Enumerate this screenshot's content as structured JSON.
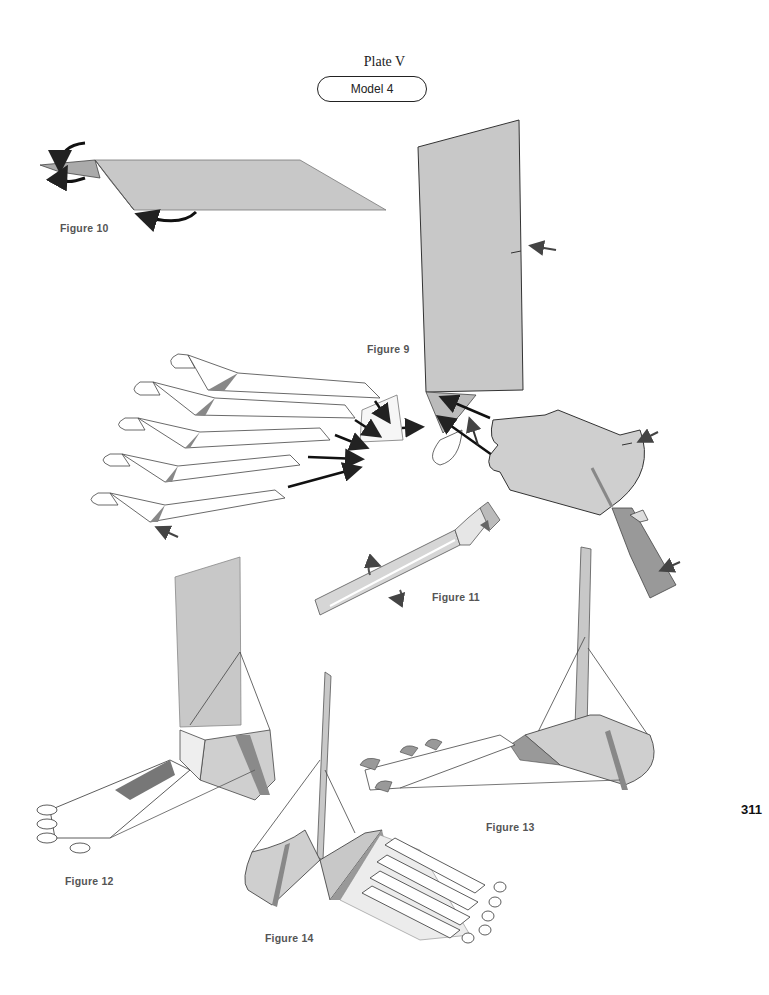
{
  "header": {
    "plate_title": "Plate V",
    "model_label": "Model 4"
  },
  "figures": [
    {
      "id": "figure-9",
      "label": "Figure 9",
      "description": "Leg panel with toe strips and heel piece exploded assembly"
    },
    {
      "id": "figure-10",
      "label": "Figure 10",
      "description": "Long flat strip with curl arrows"
    },
    {
      "id": "figure-11",
      "label": "Figure 11",
      "description": "Strip with hooked end and twist arrows"
    },
    {
      "id": "figure-12",
      "label": "Figure 12",
      "description": "Assembled foot, side view"
    },
    {
      "id": "figure-13",
      "label": "Figure 13",
      "description": "Assembled foot, angled view"
    },
    {
      "id": "figure-14",
      "label": "Figure 14",
      "description": "Assembled foot, rear view"
    }
  ],
  "page_number": "311",
  "colors": {
    "paper_gray": "#c8c8c8",
    "dark_gray": "#8a8a8a",
    "outline": "#333333",
    "label_gray": "#555555"
  }
}
